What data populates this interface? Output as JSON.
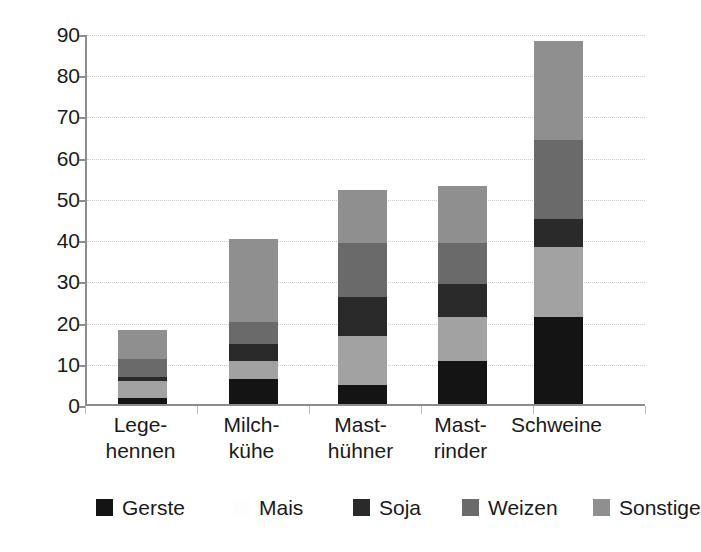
{
  "chart_data": {
    "type": "bar",
    "subtype": "stacked",
    "title": "",
    "xlabel": "",
    "ylabel": "",
    "ylim": [
      0,
      90
    ],
    "ytick_step": 10,
    "yticks": [
      0,
      10,
      20,
      30,
      40,
      50,
      60,
      70,
      80,
      90
    ],
    "ytick_labels": [
      "0",
      "10",
      "20",
      "30",
      "40",
      "50",
      "60",
      "70",
      "80",
      "90"
    ],
    "grid": "horizontal-dotted",
    "legend_position": "bottom",
    "categories": [
      "Lege-hennen",
      "Milch-kühe",
      "Mast-hühner",
      "Mast-rinder",
      "Schweine"
    ],
    "category_lines": [
      [
        "Lege-",
        "hennen"
      ],
      [
        "Milch-",
        "kühe"
      ],
      [
        "Mast-",
        "hühner"
      ],
      [
        "Mast-",
        "rinder"
      ],
      [
        "Schweine",
        ""
      ]
    ],
    "series": [
      {
        "name": "Gerste",
        "color": "#141414",
        "values": [
          1.5,
          6.0,
          4.5,
          10.5,
          21.0
        ]
      },
      {
        "name": "Mais",
        "color": "#ffffff",
        "values": [
          4.0,
          4.5,
          12.0,
          10.5,
          17.0
        ]
      },
      {
        "name": "Soja",
        "color": "#2a2a2a",
        "values": [
          1.0,
          4.0,
          9.5,
          8.0,
          7.0
        ]
      },
      {
        "name": "Weizen",
        "color": "#6a6a6a",
        "values": [
          4.5,
          5.5,
          13.0,
          10.0,
          19.0
        ]
      },
      {
        "name": "Sonstige",
        "color": "#8f8f8f",
        "values": [
          7.0,
          20.0,
          13.0,
          14.0,
          24.0
        ]
      }
    ],
    "bar_segment_colors_actual": [
      "#141414",
      "#a2a2a2",
      "#2a2a2a",
      "#6a6a6a",
      "#8f8f8f"
    ],
    "totals": [
      18,
      40,
      52,
      53,
      88
    ],
    "axis_color": "#8d8d8d",
    "grid_color": "#cfcfcf",
    "background": "#ffffff"
  },
  "legend": {
    "items": [
      {
        "label": "Gerste",
        "swatch": "#141414",
        "x": 0
      },
      {
        "label": "Mais",
        "swatch": "#fdfdfd",
        "x": 137
      },
      {
        "label": "Soja",
        "swatch": "#2a2a2a",
        "x": 257
      },
      {
        "label": "Weizen",
        "swatch": "#6a6a6a",
        "x": 366
      },
      {
        "label": "Sonstige",
        "swatch": "#8f8f8f",
        "x": 497
      }
    ]
  }
}
